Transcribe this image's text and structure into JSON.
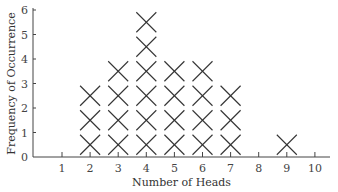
{
  "chart_data": {
    "type": "dot-plot",
    "title": "",
    "xlabel": "Number of Heads",
    "ylabel": "Frequency of Occurrence",
    "categories": [
      1,
      2,
      3,
      4,
      5,
      6,
      7,
      8,
      9,
      10
    ],
    "values": [
      0,
      3,
      4,
      6,
      4,
      4,
      3,
      0,
      1,
      0
    ],
    "x_ticks": [
      "1",
      "2",
      "3",
      "4",
      "5",
      "6",
      "7",
      "8",
      "9",
      "10"
    ],
    "y_ticks": [
      "0",
      "1",
      "2",
      "3",
      "4",
      "5",
      "6"
    ],
    "ylim": [
      0,
      6
    ],
    "marker": "X",
    "grid": false
  }
}
